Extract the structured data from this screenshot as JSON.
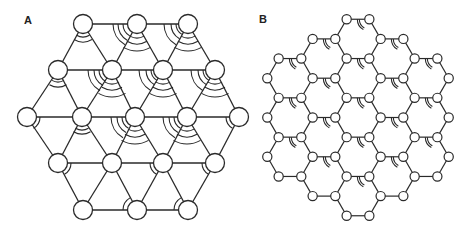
{
  "figure": {
    "panel_a": {
      "label": "A",
      "description": "Triangular lattice with angle arcs",
      "node_radius": 9.5,
      "stroke_width": 1.3,
      "nodes": [
        [
          83,
          24
        ],
        [
          137,
          24
        ],
        [
          188,
          24
        ],
        [
          58,
          70
        ],
        [
          112,
          70
        ],
        [
          163,
          70
        ],
        [
          215,
          70
        ],
        [
          27,
          117
        ],
        [
          82,
          117
        ],
        [
          135,
          117
        ],
        [
          187,
          117
        ],
        [
          239,
          117
        ],
        [
          58,
          163
        ],
        [
          112,
          163
        ],
        [
          163,
          163
        ],
        [
          215,
          163
        ],
        [
          83,
          210
        ],
        [
          137,
          210
        ],
        [
          188,
          210
        ]
      ],
      "edges": [
        [
          0,
          1
        ],
        [
          1,
          2
        ],
        [
          3,
          4
        ],
        [
          4,
          5
        ],
        [
          5,
          6
        ],
        [
          7,
          8
        ],
        [
          8,
          9
        ],
        [
          9,
          10
        ],
        [
          10,
          11
        ],
        [
          12,
          13
        ],
        [
          13,
          14
        ],
        [
          14,
          15
        ],
        [
          16,
          17
        ],
        [
          17,
          18
        ],
        [
          0,
          3
        ],
        [
          0,
          4
        ],
        [
          1,
          4
        ],
        [
          1,
          5
        ],
        [
          2,
          5
        ],
        [
          2,
          6
        ],
        [
          3,
          7
        ],
        [
          3,
          8
        ],
        [
          4,
          8
        ],
        [
          4,
          9
        ],
        [
          5,
          9
        ],
        [
          5,
          10
        ],
        [
          6,
          10
        ],
        [
          6,
          11
        ],
        [
          7,
          12
        ],
        [
          8,
          12
        ],
        [
          8,
          13
        ],
        [
          9,
          13
        ],
        [
          9,
          14
        ],
        [
          10,
          14
        ],
        [
          10,
          15
        ],
        [
          11,
          15
        ],
        [
          12,
          16
        ],
        [
          13,
          16
        ],
        [
          13,
          17
        ],
        [
          14,
          17
        ],
        [
          14,
          18
        ],
        [
          15,
          18
        ]
      ],
      "arcs": [
        {
          "node": 0,
          "from": 60,
          "to": 120,
          "radii": [
            13,
            18
          ]
        },
        {
          "node": 1,
          "from": 60,
          "to": 120,
          "radii": [
            14,
            20,
            27
          ]
        },
        {
          "node": 1,
          "from": 120,
          "to": 180,
          "radii": [
            14,
            19,
            24
          ]
        },
        {
          "node": 2,
          "from": 60,
          "to": 120,
          "radii": [
            14,
            20,
            27
          ]
        },
        {
          "node": 2,
          "from": 120,
          "to": 180,
          "radii": [
            12,
            17,
            24
          ]
        },
        {
          "node": 3,
          "from": 60,
          "to": 120,
          "radii": [
            12,
            17
          ]
        },
        {
          "node": 4,
          "from": 60,
          "to": 120,
          "radii": [
            14,
            20,
            27
          ]
        },
        {
          "node": 4,
          "from": 120,
          "to": 180,
          "radii": [
            13,
            18,
            24
          ]
        },
        {
          "node": 5,
          "from": 60,
          "to": 120,
          "radii": [
            14,
            20,
            27
          ]
        },
        {
          "node": 5,
          "from": 120,
          "to": 180,
          "radii": [
            12,
            17,
            24
          ]
        },
        {
          "node": 6,
          "from": 60,
          "to": 120,
          "radii": [
            14,
            20,
            27
          ]
        },
        {
          "node": 6,
          "from": 120,
          "to": 180,
          "radii": [
            12,
            17,
            24
          ]
        },
        {
          "node": 7,
          "from": 0,
          "to": 60,
          "radii": [
            13
          ]
        },
        {
          "node": 8,
          "from": 60,
          "to": 120,
          "radii": [
            13,
            17
          ]
        },
        {
          "node": 9,
          "from": 60,
          "to": 120,
          "radii": [
            14,
            20,
            27
          ]
        },
        {
          "node": 9,
          "from": 120,
          "to": 180,
          "radii": [
            13,
            18,
            24
          ]
        },
        {
          "node": 10,
          "from": 60,
          "to": 120,
          "radii": [
            14,
            20,
            27
          ]
        },
        {
          "node": 10,
          "from": 120,
          "to": 180,
          "radii": [
            13,
            18,
            24
          ]
        },
        {
          "node": 11,
          "from": 120,
          "to": 180,
          "radii": [
            13
          ]
        },
        {
          "node": 12,
          "from": 0,
          "to": 60,
          "radii": [
            13
          ]
        },
        {
          "node": 14,
          "from": 120,
          "to": 180,
          "radii": [
            13
          ]
        },
        {
          "node": 15,
          "from": 120,
          "to": 180,
          "radii": [
            13
          ]
        },
        {
          "node": 17,
          "from": 180,
          "to": 240,
          "radii": [
            14
          ]
        },
        {
          "node": 18,
          "from": 180,
          "to": 240,
          "radii": [
            14
          ]
        }
      ]
    },
    "panel_b": {
      "label": "B",
      "description": "Honeycomb lattice of 19 hexagons with angle arcs",
      "node_radius": 4.6,
      "stroke_width": 1.2,
      "edge_length": 22.7,
      "center": [
        358,
        117.5
      ],
      "column_spacing": 34,
      "row_spacing": 39.3,
      "hex_ring_radius": 2,
      "arc": {
        "vertex": "top-right",
        "from": 120,
        "to": 180,
        "radii": [
          10,
          12
        ]
      }
    }
  }
}
